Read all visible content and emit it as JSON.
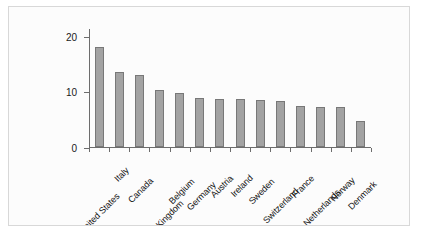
{
  "chart_data": {
    "type": "bar",
    "title": "",
    "subtitle": "",
    "xlabel": "",
    "ylabel": "",
    "categories": [
      "United States",
      "Italy",
      "Canada",
      "United Kingdom",
      "Belgium",
      "Germany",
      "Austria",
      "Ireland",
      "Sweden",
      "Switzerland",
      "France",
      "Netherlands",
      "Norway",
      "Denmark"
    ],
    "values": [
      18.2,
      13.6,
      13.1,
      10.4,
      9.8,
      8.9,
      8.8,
      8.7,
      8.6,
      8.4,
      7.5,
      7.3,
      7.2,
      4.7
    ],
    "ylim": [
      0,
      21.6
    ],
    "yticks": [
      0,
      10,
      20
    ],
    "ytick_labels": [
      "0",
      "10",
      "20"
    ],
    "grid": false,
    "legend": null,
    "bar_color": "#a3a3a3",
    "bar_edge_color": "#787878",
    "axis_color": "#6d6d6d",
    "background_color": "#fcfcfc",
    "frame_border_color": "#d8d8d8"
  }
}
